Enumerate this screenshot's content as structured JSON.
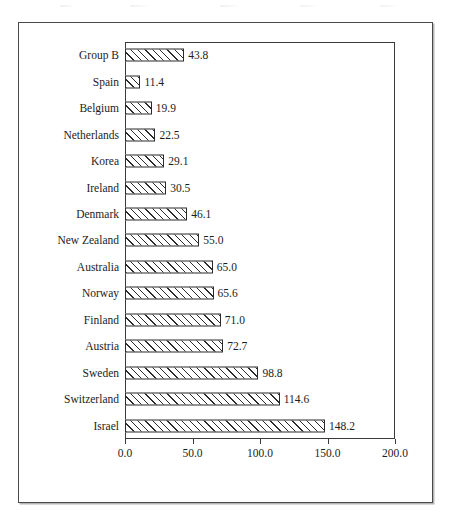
{
  "chart_data": {
    "type": "bar",
    "orientation": "horizontal",
    "title": "",
    "subtitle": "",
    "xlabel": "",
    "ylabel": "",
    "xlim": [
      0.0,
      200.0
    ],
    "xticks": [
      "0.0",
      "50.0",
      "100.0",
      "150.0",
      "200.0"
    ],
    "xtick_values": [
      0,
      50,
      100,
      150,
      200
    ],
    "grid": false,
    "legend": null,
    "bar_style": {
      "fill": "#ffffff",
      "hatch": "forward-diagonal",
      "edge_color": "#2b2b2b"
    },
    "categories": [
      "Group B",
      "Spain",
      "Belgium",
      "Netherlands",
      "Korea",
      "Ireland",
      "Denmark",
      "New Zealand",
      "Australia",
      "Norway",
      "Finland",
      "Austria",
      "Sweden",
      "Switzerland",
      "Israel"
    ],
    "values": [
      43.8,
      11.4,
      19.9,
      22.5,
      29.1,
      30.5,
      46.1,
      55.0,
      65.0,
      65.6,
      71.0,
      72.7,
      98.8,
      114.6,
      148.2
    ],
    "value_labels": [
      "43.8",
      "11.4",
      "19.9",
      "22.5",
      "29.1",
      "30.5",
      "46.1",
      "55.0",
      "65.0",
      "65.6",
      "71.0",
      "72.7",
      "98.8",
      "114.6",
      "148.2"
    ]
  }
}
